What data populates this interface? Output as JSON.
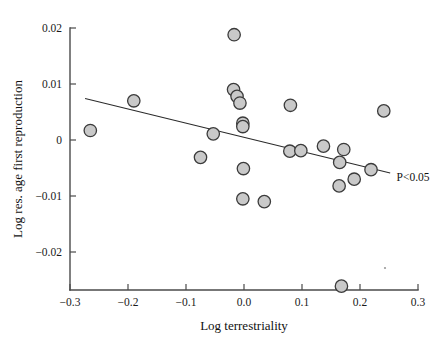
{
  "chart_data": {
    "type": "scatter",
    "title": "",
    "xlabel": "Log terrestriality",
    "ylabel": "Log res. age first reproduction",
    "xlim": [
      -0.3,
      0.3
    ],
    "ylim": [
      -0.028,
      0.021
    ],
    "xticks": [
      -0.3,
      -0.2,
      -0.1,
      0.0,
      0.1,
      0.2,
      0.3
    ],
    "xtick_labels": [
      "−0.3",
      "−0.2",
      "−0.1",
      "0.0",
      "0.1",
      "0.2",
      "0.3"
    ],
    "yticks": [
      -0.02,
      -0.01,
      0,
      0.01,
      0.02
    ],
    "ytick_labels": [
      "−0.02",
      "−0.01",
      "0",
      "0.01",
      "0.02"
    ],
    "grid": false,
    "legend": false,
    "marker": {
      "shape": "circle",
      "fill_color": "#c9c9c9",
      "edge_color": "#3b3b3b",
      "radius_px": 6.2
    },
    "points": [
      {
        "x": -0.265,
        "y": 0.0017
      },
      {
        "x": -0.19,
        "y": 0.007
      },
      {
        "x": -0.075,
        "y": -0.0031
      },
      {
        "x": -0.053,
        "y": 0.0011
      },
      {
        "x": -0.018,
        "y": 0.009
      },
      {
        "x": -0.012,
        "y": 0.0078
      },
      {
        "x": -0.007,
        "y": 0.0066
      },
      {
        "x": -0.002,
        "y": 0.003
      },
      {
        "x": -0.002,
        "y": 0.0024
      },
      {
        "x": -0.017,
        "y": 0.0188
      },
      {
        "x": -0.001,
        "y": -0.0051
      },
      {
        "x": -0.002,
        "y": -0.0105
      },
      {
        "x": 0.035,
        "y": -0.011
      },
      {
        "x": 0.08,
        "y": 0.0062
      },
      {
        "x": 0.079,
        "y": -0.002
      },
      {
        "x": 0.098,
        "y": -0.0019
      },
      {
        "x": 0.137,
        "y": -0.0011
      },
      {
        "x": 0.165,
        "y": -0.004
      },
      {
        "x": 0.164,
        "y": -0.0082
      },
      {
        "x": 0.172,
        "y": -0.0017
      },
      {
        "x": 0.19,
        "y": -0.007
      },
      {
        "x": 0.219,
        "y": -0.0053
      },
      {
        "x": 0.241,
        "y": 0.0052
      },
      {
        "x": 0.168,
        "y": -0.0261
      }
    ],
    "trend_line": {
      "x_start": -0.274,
      "y_start": 0.0074,
      "x_end": 0.252,
      "y_end": -0.0059,
      "style": "solid",
      "color": "#2b2b2b"
    },
    "annotations": [
      {
        "text": "P<0.05",
        "x": 0.263,
        "y": -0.0073
      }
    ]
  }
}
